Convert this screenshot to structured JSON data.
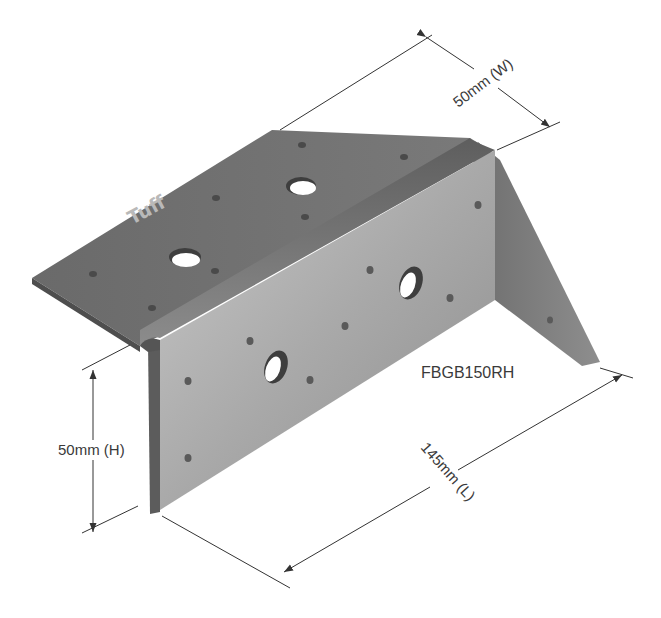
{
  "diagram": {
    "brand_mark": "Tuff",
    "model_label": "FBGB150RH",
    "dimensions": {
      "width": {
        "label": "50mm (W)",
        "value": 50,
        "unit": "mm",
        "axis": "W"
      },
      "height": {
        "label": "50mm (H)",
        "value": 50,
        "unit": "mm",
        "axis": "H"
      },
      "length": {
        "label": "145mm (L)",
        "value": 145,
        "unit": "mm",
        "axis": "L"
      }
    },
    "colors": {
      "top_face": "#6e6e6e",
      "side_face_light": "#b5b5b5",
      "side_face_dark": "#8a8a8a",
      "end_face": "#7a7a7a",
      "line": "#333333",
      "text": "#3a3a3a"
    }
  }
}
